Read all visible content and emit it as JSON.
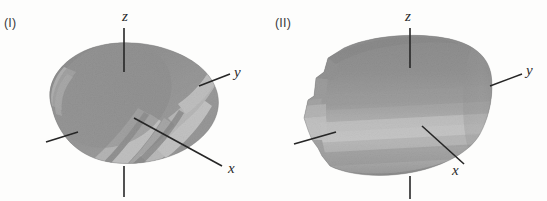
{
  "figure": {
    "background_color": "#fdfdfc",
    "ink_color": "#2b2b2b",
    "panels": [
      {
        "id": "I",
        "tag": "(I)",
        "object": "shaded-cylinder-oblique",
        "axes": [
          {
            "name": "z",
            "label": "z",
            "orientation": "vertical-up"
          },
          {
            "name": "y",
            "label": "y",
            "orientation": "diagonal-upper-right"
          },
          {
            "name": "x",
            "label": "x",
            "orientation": "diagonal-lower-right"
          }
        ],
        "shading": {
          "band_tones": [
            "#6f6f6f",
            "#8a8a8a",
            "#a6a6a6",
            "#c9c9c9",
            "#e8e8e8",
            "#f4f4f4"
          ],
          "base_tone": "#8d8d8d",
          "dark_tone": "#5f5f5f",
          "highlight_tone": "#f2f2f2"
        }
      },
      {
        "id": "II",
        "tag": "(II)",
        "object": "shaded-cylinder-side",
        "axes": [
          {
            "name": "z",
            "label": "z",
            "orientation": "vertical-up"
          },
          {
            "name": "y",
            "label": "y",
            "orientation": "diagonal-upper-right"
          },
          {
            "name": "x",
            "label": "x",
            "orientation": "diagonal-lower-right"
          }
        ],
        "shading": {
          "band_tones": [
            "#757575",
            "#8f8f8f",
            "#adadad",
            "#d2d2d2",
            "#efefef",
            "#f7f7f7"
          ],
          "base_tone": "#909090",
          "dark_tone": "#636363",
          "highlight_tone": "#f5f5f5"
        }
      }
    ]
  }
}
